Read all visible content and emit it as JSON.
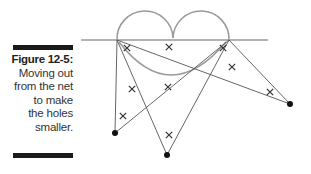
{
  "caption": {
    "figure_label": "Figure 12-5:",
    "lines": [
      "Moving out",
      "from the net",
      "to make",
      "the holes",
      "smaller."
    ]
  },
  "diagram": {
    "colors": {
      "net": "#9a9a9a",
      "lines": "#555555",
      "marks": "#333333",
      "dots": "#111111"
    },
    "players": [
      {
        "id": "left-player"
      },
      {
        "id": "bottom-player"
      },
      {
        "id": "right-player"
      }
    ],
    "hole_marks_count": 10
  }
}
